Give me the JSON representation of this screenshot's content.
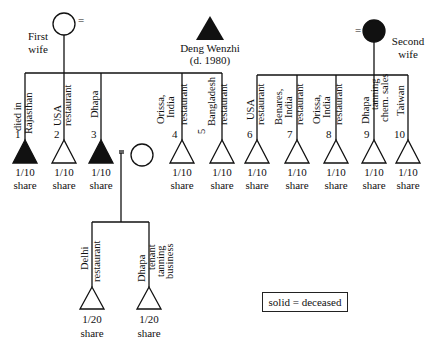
{
  "parents": {
    "father": {
      "name": "Deng Wenzhi",
      "note": "(d. 1980)",
      "symbol": "triangle",
      "deceased": true
    },
    "first_wife": {
      "label_line1": "First",
      "label_line2": "wife",
      "symbol": "circle",
      "deceased": false
    },
    "second_wife": {
      "label_line1": "Second",
      "label_line2": "wife",
      "symbol": "circle",
      "deceased": true
    },
    "marriage_symbol": "="
  },
  "children": [
    {
      "num": "1",
      "line1": "died in",
      "line2": "Rajasthan",
      "share": "1/10",
      "share_label": "share",
      "deceased": true,
      "mother": "first"
    },
    {
      "num": "2",
      "line1": "USA",
      "line2": "restaurant",
      "share": "1/10",
      "share_label": "share",
      "deceased": false,
      "mother": "first"
    },
    {
      "num": "3",
      "line1": "Dhapa",
      "line2": "",
      "share": "1/10",
      "share_label": "share",
      "deceased": true,
      "mother": "first"
    },
    {
      "num": "4",
      "line1": "Orissa,",
      "line2": "India",
      "line3": "restaurant",
      "share": "1/10",
      "share_label": "share",
      "deceased": false,
      "mother": "first"
    },
    {
      "num": "5",
      "line1": "Bangladesh",
      "line2": "restaurant",
      "share": "1/10",
      "share_label": "share",
      "deceased": false,
      "mother": "first"
    },
    {
      "num": "6",
      "line1": "USA",
      "line2": "restaurant",
      "share": "1/10",
      "share_label": "share",
      "deceased": false,
      "mother": "second"
    },
    {
      "num": "7",
      "line1": "Benares,",
      "line2": "India",
      "line3": "restaurant",
      "share": "1/10",
      "share_label": "share",
      "deceased": false,
      "mother": "second"
    },
    {
      "num": "8",
      "line1": "Orissa,",
      "line2": "India",
      "line3": "restaurant",
      "share": "1/10",
      "share_label": "share",
      "deceased": false,
      "mother": "second"
    },
    {
      "num": "9",
      "line1": "Dhapa",
      "line2": "tanning",
      "line3": "chem. sales",
      "share": "1/10",
      "share_label": "share",
      "deceased": false,
      "mother": "second"
    },
    {
      "num": "10",
      "line1": "Taiwan",
      "line2": "",
      "share": "1/10",
      "share_label": "share",
      "deceased": false,
      "mother": "second"
    }
  ],
  "grandchildren": [
    {
      "line1": "Delhi",
      "line2": "restaurant",
      "share": "1/20",
      "share_label": "share",
      "deceased": false
    },
    {
      "line1": "Dhapa",
      "line2": "tenant",
      "line3": "tanning",
      "line4": "business",
      "share": "1/20",
      "share_label": "share",
      "deceased": false
    }
  ],
  "legend": {
    "text": "solid = deceased"
  }
}
